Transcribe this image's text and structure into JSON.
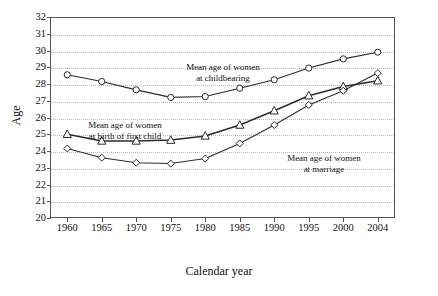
{
  "chart_data": {
    "type": "line",
    "title": "",
    "xlabel": "Calendar year",
    "ylabel": "Age",
    "categories": [
      "1960",
      "1965",
      "1970",
      "1975",
      "1980",
      "1985",
      "1990",
      "1995",
      "2000",
      "2004"
    ],
    "ylim": [
      20,
      32
    ],
    "ytick_values": [
      "20",
      "21",
      "22",
      "23",
      "24",
      "25",
      "26",
      "27",
      "28",
      "29",
      "30",
      "31",
      "32"
    ],
    "grid": true,
    "legend_position": "inline-annotations",
    "series": [
      {
        "name": "Mean age of women at childbearing",
        "marker": "circle",
        "values": [
          28.55,
          28.15,
          27.65,
          27.2,
          27.25,
          27.75,
          28.25,
          28.95,
          29.5,
          29.9
        ]
      },
      {
        "name": "Mean age of women at birth of first child",
        "marker": "triangle",
        "values": [
          25.0,
          24.6,
          24.6,
          24.65,
          24.9,
          25.55,
          26.4,
          27.3,
          27.85,
          28.2
        ]
      },
      {
        "name": "Mean age of women at marriage",
        "marker": "diamond",
        "values": [
          24.15,
          23.6,
          23.3,
          23.25,
          23.55,
          24.45,
          25.55,
          26.75,
          27.6,
          28.65
        ]
      }
    ],
    "annotations": [
      {
        "id": "childbearing",
        "line1": "Mean age of women",
        "line2": "at childbearing"
      },
      {
        "id": "first-child",
        "line1": "Mean age of women",
        "line2": "at birth of first child"
      },
      {
        "id": "marriage",
        "line1": "Mean age of women",
        "line2": "at marriage"
      }
    ],
    "colors": {
      "line": "#2b2b2b",
      "marker_fill": "#ffffff",
      "grid": "#b9b9b9",
      "frame": "#555555"
    }
  }
}
